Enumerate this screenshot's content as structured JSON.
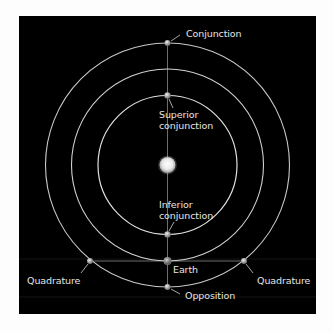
{
  "diagram": {
    "colors": {
      "background": "#000000",
      "page": "#fdfdfd",
      "orbit": "#d8d8d8",
      "line": "#9a9a9a",
      "label": "#e6e6e6",
      "sun": "#f2f2f2"
    },
    "center": {
      "x": 167.5,
      "y": 165
    },
    "orbits": [
      {
        "name": "inferior-planet-orbit",
        "radius": 69.5
      },
      {
        "name": "earth-orbit",
        "radius": 96
      },
      {
        "name": "superior-planet-orbit",
        "radius": 122
      }
    ],
    "labels": {
      "conjunction": "Conjunction",
      "superior_line1": "Superior",
      "superior_line2": "conjunction",
      "inferior_line1": "Inferior",
      "inferior_line2": "conjunction",
      "earth": "Earth",
      "quadrature_left": "Quadrature",
      "quadrature_right": "Quadrature",
      "opposition": "Opposition"
    },
    "bodies": [
      {
        "name": "sun",
        "x": 167.5,
        "y": 165,
        "r": 8
      },
      {
        "name": "conjunction-planet",
        "x": 167.5,
        "y": 43,
        "r": 3
      },
      {
        "name": "superior-conjunction-planet",
        "x": 167.5,
        "y": 95.5,
        "r": 3
      },
      {
        "name": "inferior-conjunction-planet",
        "x": 167.5,
        "y": 234.5,
        "r": 3
      },
      {
        "name": "earth",
        "x": 167.5,
        "y": 261,
        "r": 3.5
      },
      {
        "name": "quadrature-left-planet",
        "x": 90,
        "y": 261,
        "r": 3
      },
      {
        "name": "quadrature-right-planet",
        "x": 244,
        "y": 261,
        "r": 3
      },
      {
        "name": "opposition-planet",
        "x": 167.5,
        "y": 287,
        "r": 3
      }
    ]
  }
}
